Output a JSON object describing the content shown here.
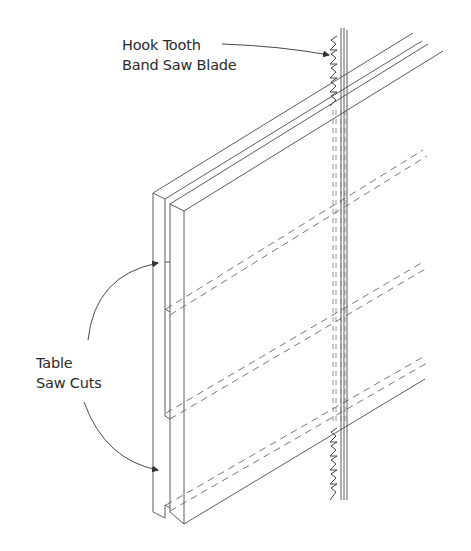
{
  "diagram": {
    "type": "technical-illustration",
    "labels": {
      "blade_line1": "Hook Tooth",
      "blade_line2": "Band Saw Blade",
      "cuts_line1": "Table",
      "cuts_line2": "Saw Cuts"
    },
    "colors": {
      "line": "#4a4a4a",
      "text": "#2a2a2a",
      "background": "#ffffff"
    }
  }
}
